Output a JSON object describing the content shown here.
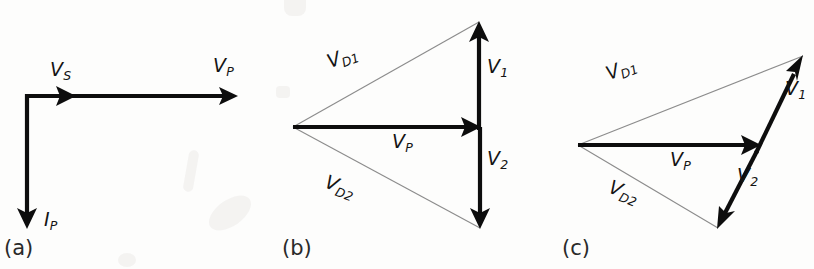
{
  "figure": {
    "type": "phasor-vector-diagram-set",
    "background_color": "#fdfdfc",
    "ink_color": "#0d0d0d",
    "thin_line_color": "#8c8c8c",
    "panel_count": 3,
    "partial_caption_text": ""
  },
  "panels": [
    {
      "id": "a",
      "tag": "(a)",
      "vectors": [
        {
          "name": "V_S",
          "label_base": "V",
          "label_sub": "S",
          "style": "solid-bold",
          "from": [
            25,
            96
          ],
          "to": [
            75,
            96
          ],
          "direction": "right",
          "label_pos": [
            50,
            62
          ]
        },
        {
          "name": "V_P",
          "label_base": "V",
          "label_sub": "P",
          "style": "solid-bold",
          "from": [
            25,
            96
          ],
          "to": [
            238,
            96
          ],
          "direction": "right",
          "label_pos": [
            212,
            58
          ]
        },
        {
          "name": "I_P",
          "label_base": "I",
          "label_sub": "P",
          "style": "solid-bold",
          "from": [
            27,
            96
          ],
          "to": [
            27,
            228
          ],
          "direction": "down",
          "label_pos": [
            44,
            212
          ]
        }
      ]
    },
    {
      "id": "b",
      "tag": "(b)",
      "vectors": [
        {
          "name": "V_P",
          "label_base": "V",
          "label_sub": "P",
          "style": "solid-bold",
          "from": [
            293,
            127
          ],
          "to": [
            480,
            127
          ],
          "direction": "right",
          "label_pos": [
            394,
            133
          ]
        },
        {
          "name": "V_1",
          "label_base": "V",
          "label_sub": "1",
          "style": "solid-bold",
          "from": [
            479,
            127
          ],
          "to": [
            479,
            22
          ],
          "direction": "up",
          "label_pos": [
            487,
            58
          ]
        },
        {
          "name": "V_2",
          "label_base": "V",
          "label_sub": "2",
          "style": "solid-bold",
          "from": [
            480,
            127
          ],
          "to": [
            480,
            228
          ],
          "direction": "down",
          "label_pos": [
            487,
            150
          ]
        },
        {
          "name": "V_D1",
          "label_base": "V",
          "label_sub": "D1",
          "style": "thin",
          "from": [
            293,
            127
          ],
          "to": [
            479,
            22
          ],
          "direction": "none",
          "label_pos": [
            335,
            53
          ]
        },
        {
          "name": "V_D2",
          "label_base": "V",
          "label_sub": "D2",
          "style": "thin",
          "from": [
            293,
            127
          ],
          "to": [
            480,
            228
          ],
          "direction": "none",
          "label_pos": [
            333,
            175
          ]
        }
      ]
    },
    {
      "id": "c",
      "tag": "(c)",
      "vectors": [
        {
          "name": "V_P",
          "label_base": "V",
          "label_sub": "P",
          "style": "solid-bold",
          "from": [
            578,
            145
          ],
          "to": [
            760,
            145
          ],
          "direction": "right",
          "label_pos": [
            672,
            151
          ]
        },
        {
          "name": "V_1",
          "label_base": "V",
          "label_sub": "1",
          "style": "solid-bold",
          "from": [
            757,
            152
          ],
          "to": [
            803,
            56
          ],
          "direction": "up-right",
          "label_pos": [
            786,
            80
          ]
        },
        {
          "name": "V_2",
          "label_base": "V",
          "label_sub": "2",
          "style": "solid-bold",
          "from": [
            757,
            152
          ],
          "to": [
            718,
            228
          ],
          "direction": "down-left",
          "label_pos": [
            738,
            168
          ]
        },
        {
          "name": "V_D1",
          "label_base": "V",
          "label_sub": "D1",
          "style": "thin",
          "from": [
            578,
            145
          ],
          "to": [
            803,
            56
          ],
          "direction": "none",
          "label_pos": [
            614,
            66
          ]
        },
        {
          "name": "V_D2",
          "label_base": "V",
          "label_sub": "D2",
          "style": "thin",
          "from": [
            578,
            145
          ],
          "to": [
            718,
            228
          ],
          "direction": "none",
          "label_pos": [
            617,
            180
          ]
        }
      ]
    }
  ],
  "labels": {
    "a_vs_base": "V",
    "a_vs_sub": "S",
    "a_vp_base": "V",
    "a_vp_sub": "P",
    "a_ip_base": "I",
    "a_ip_sub": "P",
    "a_tag": "(a)",
    "b_vp_base": "V",
    "b_vp_sub": "P",
    "b_v1_base": "V",
    "b_v1_sub": "1",
    "b_v2_base": "V",
    "b_v2_sub": "2",
    "b_vd1_base": "V",
    "b_vd1_sub": "D1",
    "b_vd2_base": "V",
    "b_vd2_sub": "D2",
    "b_tag": "(b)",
    "c_vp_base": "V",
    "c_vp_sub": "P",
    "c_v1_base": "V",
    "c_v1_sub": "1",
    "c_v2_base": "V",
    "c_v2_sub": "2",
    "c_vd1_base": "V",
    "c_vd1_sub": "D1",
    "c_vd2_base": "V",
    "c_vd2_sub": "D2",
    "c_tag": "(c)"
  }
}
